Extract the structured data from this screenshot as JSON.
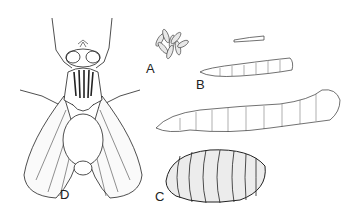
{
  "figure": {
    "labels": {
      "eggs": "A",
      "larvae": "B",
      "pupa": "C",
      "adult": "D"
    }
  }
}
